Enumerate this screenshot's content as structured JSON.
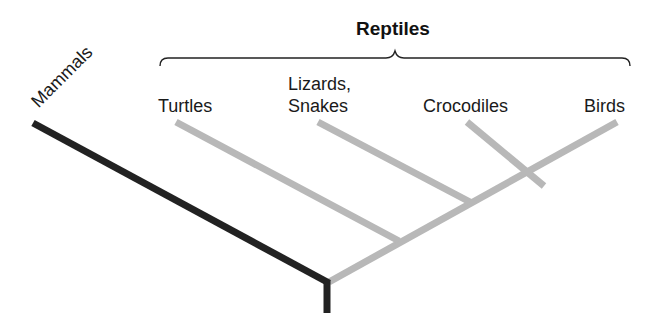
{
  "diagram": {
    "type": "cladogram",
    "group_label": "Reptiles",
    "outgroup": {
      "label": "Mammals",
      "color": "#222222"
    },
    "taxa": [
      {
        "label": "Turtles"
      },
      {
        "label_line1": "Lizards,",
        "label_line2": "Snakes"
      },
      {
        "label": "Crocodiles"
      },
      {
        "label": "Birds"
      }
    ],
    "colors": {
      "outgroup_branch": "#222222",
      "ingroup_branch": "#b8b8b8",
      "brace": "#222222",
      "background": "#ffffff"
    }
  }
}
